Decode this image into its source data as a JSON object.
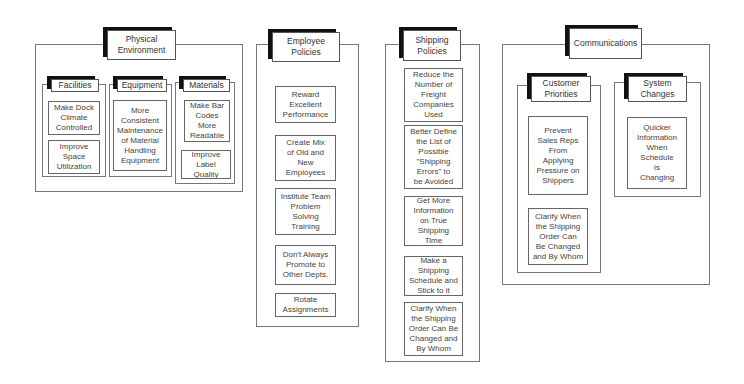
{
  "groups": {
    "physical": {
      "title": "Physical\nEnvironment",
      "facilities": {
        "title": "Facilities",
        "items": [
          "Make Dock\nClimate\nControlled",
          "Improve\nSpace\nUtilization"
        ]
      },
      "equipment": {
        "title": "Equipment",
        "items": [
          "More\nConsistent\nMaintenance\nof Material\nHandling\nEquipment"
        ]
      },
      "materials": {
        "title": "Materials",
        "items": [
          "Make Bar\nCodes\nMore\nReadable",
          "Improve\nLabel\nQuality"
        ]
      }
    },
    "employee": {
      "title": "Employee\nPolicies",
      "items": [
        "Reward\nExcellent\nPerformance",
        "Create Mix\nof Old and\nNew\nEmployees",
        "Institute Team\nProblem\nSolving\nTraining",
        "Don't Always\nPromote to\nOther Depts.",
        "Rotate\nAssignments"
      ]
    },
    "shipping": {
      "title": "Shipping\nPolicies",
      "items": [
        "Reduce the\nNumber of\nFreight\nCompanies\nUsed",
        "Better Define\nthe List of\nPossible\n\"Shipping\nErrors\" to\nbe Avoided",
        "Get More\nInformation\non True\nShipping\nTime",
        "Make a\nShipping\nSchedule and\nStick to it",
        "Clarify When\nthe Shipping\nOrder Can Be\nChanged and\nBy Whom"
      ]
    },
    "communications": {
      "title": "Communications",
      "customer": {
        "title": "Customer\nPriorities",
        "items": [
          "Prevent\nSales Reps\nFrom\nApplying\nPressure on\nShippers",
          "Clarify When\nthe Shipping\nOrder Can\nBe Changed\nand By Whom"
        ]
      },
      "system": {
        "title": "System\nChanges",
        "items": [
          "Quicker\nInformation\nWhen\nSchedule\nis\nChanging"
        ]
      }
    }
  }
}
